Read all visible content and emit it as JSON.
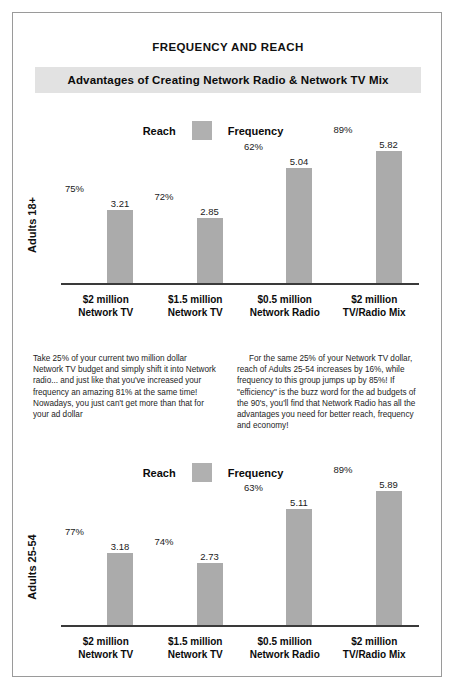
{
  "document": {
    "title": "FREQUENCY AND REACH",
    "banner": "Advantages of Creating Network Radio & Network TV Mix"
  },
  "legend": {
    "reach_label": "Reach",
    "frequency_label": "Frequency",
    "swatch_color": "#b0b0b0"
  },
  "body": {
    "left_paragraph": "Take 25% of your current two million dollar Network TV budget and simply shift it into Network radio... and just like that you've increased your frequency an amazing 81% at the same time! Nowadays, you just can't get more than that for your ad dollar",
    "right_paragraph": "For the same 25% of your Network TV dollar, reach of Adults 25-54 increases by 16%, while frequency to this group jumps up by 85%! If \"efficiency\" is the buzz word for the ad budgets of the 90's, you'll find that Network Radio has all the advantages you need  for better reach, frequency and economy!"
  },
  "chart_data": [
    {
      "type": "bar",
      "title": "Adults 18+",
      "ylabel": "Adults 18+",
      "xlabel": "",
      "grid": false,
      "legend_position": "top-center",
      "categories": [
        "$2 million\nNetwork TV",
        "$1.5 million\nNetwork TV",
        "$0.5 million\nNetwork Radio",
        "$2 million\nTV/Radio Mix"
      ],
      "categories_lines": [
        [
          "$2 million",
          "Network TV"
        ],
        [
          "$1.5 million",
          "Network TV"
        ],
        [
          "$0.5 million",
          "Network Radio"
        ],
        [
          "$2 million",
          "TV/Radio Mix"
        ]
      ],
      "series": [
        {
          "name": "Frequency",
          "values": [
            3.21,
            2.85,
            5.04,
            5.82
          ],
          "labels": [
            "3.21",
            "2.85",
            "5.04",
            "5.82"
          ]
        },
        {
          "name": "Reach",
          "values": [
            75,
            72,
            62,
            89
          ],
          "labels": [
            "75%",
            "72%",
            "62%",
            "89%"
          ]
        }
      ],
      "ylim": [
        0,
        6.6
      ]
    },
    {
      "type": "bar",
      "title": "Adults 25-54",
      "ylabel": "Adults 25-54",
      "xlabel": "",
      "grid": false,
      "legend_position": "top-center",
      "categories": [
        "$2 million\nNetwork TV",
        "$1.5 million\nNetwork TV",
        "$0.5 million\nNetwork Radio",
        "$2 million\nTV/Radio Mix"
      ],
      "categories_lines": [
        [
          "$2 million",
          "Network TV"
        ],
        [
          "$1.5 million",
          "Network TV"
        ],
        [
          "$0.5 million",
          "Network Radio"
        ],
        [
          "$2 million",
          "TV/Radio Mix"
        ]
      ],
      "series": [
        {
          "name": "Frequency",
          "values": [
            3.18,
            2.73,
            5.11,
            5.89
          ],
          "labels": [
            "3.18",
            "2.73",
            "5.11",
            "5.89"
          ]
        },
        {
          "name": "Reach",
          "values": [
            77,
            74,
            63,
            89
          ],
          "labels": [
            "77%",
            "74%",
            "63%",
            "89%"
          ]
        }
      ],
      "ylim": [
        0,
        6.6
      ]
    }
  ]
}
